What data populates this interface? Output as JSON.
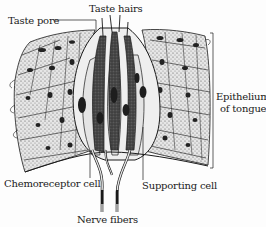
{
  "diagram": {
    "labels": {
      "taste_pore": "Taste pore",
      "taste_hairs": "Taste hairs",
      "epithelium_line1": "Epithelium",
      "epithelium_line2": "of tongue",
      "chemoreceptor_cell": "Chemoreceptor cell",
      "supporting_cell": "Supporting cell",
      "nerve_fibers": "Nerve fibers"
    },
    "colors": {
      "ink": "#1a1a1a",
      "receptor_dark": "#3a3a3a",
      "support_light": "#e4e4e4",
      "epithelium_fill": "#cfcfcf"
    }
  }
}
